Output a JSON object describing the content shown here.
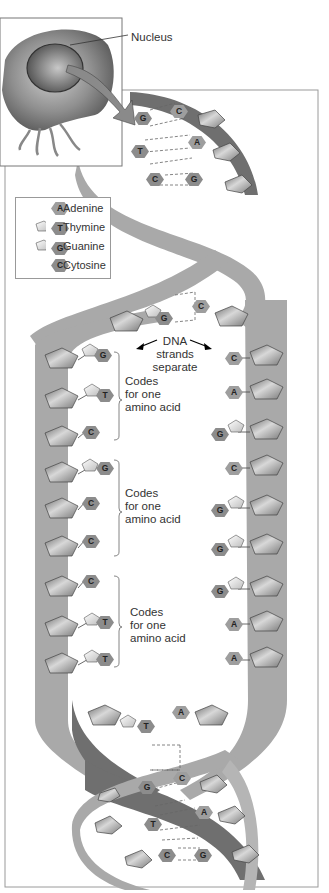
{
  "diagram": {
    "callout_label": "Nucleus",
    "center_label": [
      "DNA",
      "strands",
      "separate"
    ],
    "legend": [
      {
        "letter": "A",
        "name": "Adenine"
      },
      {
        "letter": "T",
        "name": "Thymine"
      },
      {
        "letter": "G",
        "name": "Guanine"
      },
      {
        "letter": "C",
        "name": "Cytosine"
      }
    ],
    "codon_labels": [
      {
        "line1": "Codes",
        "line2": "for one",
        "line3": "amino acid"
      },
      {
        "line1": "Codes",
        "line2": "for one",
        "line3": "amino acid"
      },
      {
        "line1": "Codes",
        "line2": "for one",
        "line3": "amino acid"
      }
    ],
    "top_helix_pairs": [
      {
        "left": "G",
        "right": "C"
      },
      {
        "left": "T",
        "right": "A"
      },
      {
        "left": "C",
        "right": "G"
      }
    ],
    "separation_pair": {
      "left": "G",
      "right": "C"
    },
    "left_strand_bases": [
      "G",
      "T",
      "C",
      "G",
      "C",
      "C",
      "C",
      "T",
      "T"
    ],
    "right_strand_bases": [
      "C",
      "A",
      "G",
      "C",
      "G",
      "G",
      "G",
      "A",
      "A"
    ],
    "rejoin_pair": {
      "left": "T",
      "right": "A"
    },
    "bottom_helix_pairs": [
      {
        "left": "G",
        "right": "C"
      },
      {
        "left": "T",
        "right": "A"
      },
      {
        "left": "C",
        "right": "G"
      }
    ],
    "colors": {
      "strand_light": "#a9a9a9",
      "strand_dark": "#6f6f6f",
      "base_fill": "#8c8c8c",
      "sugar_fill": "#9a9a9a",
      "frame": "#9a9a9a",
      "text": "#333333"
    }
  }
}
